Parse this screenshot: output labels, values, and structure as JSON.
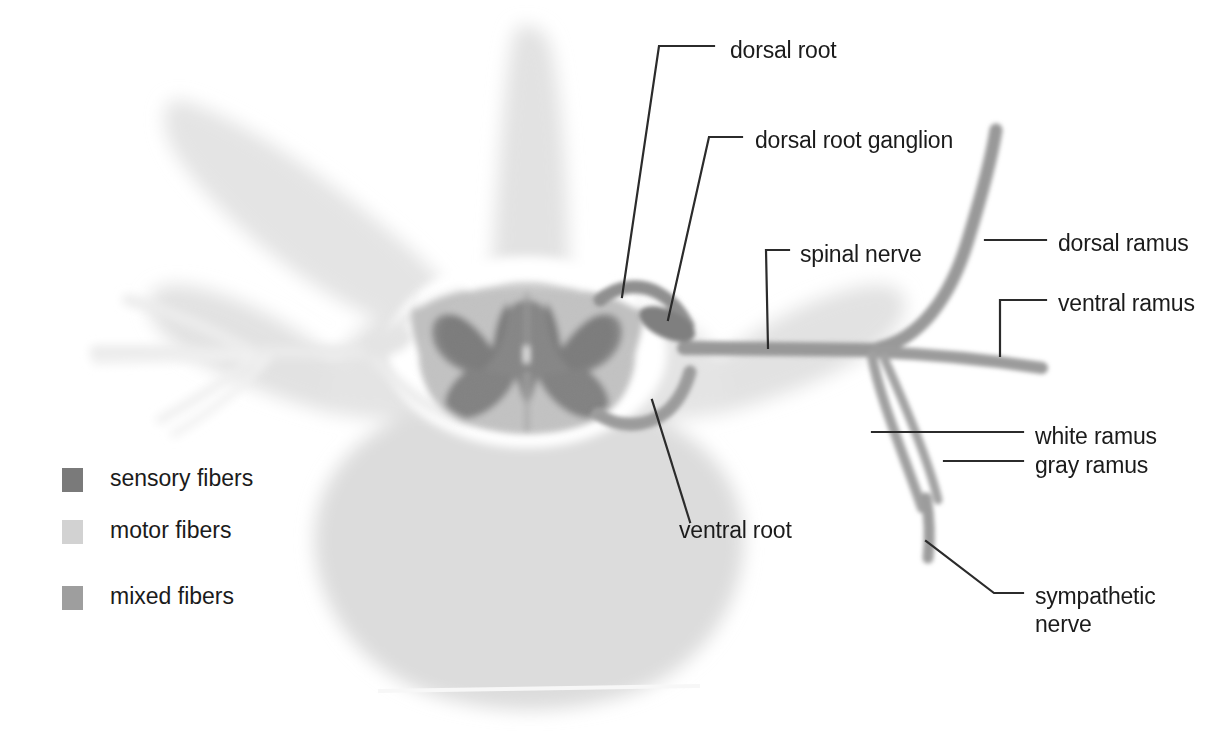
{
  "figure": {
    "background_color": "#ffffff",
    "width": 1218,
    "height": 747
  },
  "colors": {
    "sensory_fibers": "#7a7a7a",
    "motor_fibers": "#d2d2d2",
    "mixed_fibers": "#9e9e9e",
    "vertebra_bone": "#e2e2e2",
    "vertebral_body": "#dcdcdc",
    "cord_white_matter": "#bdbdbd",
    "cord_gray_matter": "#8a8a8a",
    "leader_line": "#2b2b2b",
    "text": "#1b1b1b",
    "faded_nerve": "#ededed"
  },
  "labels": [
    {
      "id": "dorsal-root",
      "text": "dorsal root",
      "x": 730,
      "y": 37
    },
    {
      "id": "dorsal-root-ganglion",
      "text": "dorsal root ganglion",
      "x": 755,
      "y": 127
    },
    {
      "id": "spinal-nerve",
      "text": "spinal nerve",
      "x": 800,
      "y": 241
    },
    {
      "id": "dorsal-ramus",
      "text": "dorsal ramus",
      "x": 1058,
      "y": 230
    },
    {
      "id": "ventral-ramus",
      "text": "ventral ramus",
      "x": 1058,
      "y": 290
    },
    {
      "id": "white-ramus",
      "text": "white ramus",
      "x": 1035,
      "y": 423
    },
    {
      "id": "gray-ramus",
      "text": "gray ramus",
      "x": 1035,
      "y": 452
    },
    {
      "id": "ventral-root",
      "text": "ventral root",
      "x": 679,
      "y": 517
    },
    {
      "id": "sympathetic-nerve-1",
      "text": "sympathetic",
      "x": 1035,
      "y": 583
    },
    {
      "id": "sympathetic-nerve-2",
      "text": "nerve",
      "x": 1035,
      "y": 611
    }
  ],
  "legend": {
    "items": [
      {
        "id": "sensory-fibers",
        "label": "sensory fibers",
        "color": "#7a7a7a",
        "swatch_x": 62,
        "swatch_y": 468,
        "text_x": 110,
        "text_y": 465
      },
      {
        "id": "motor-fibers",
        "label": "motor fibers",
        "color": "#d2d2d2",
        "swatch_x": 62,
        "swatch_y": 520,
        "text_x": 110,
        "text_y": 517
      },
      {
        "id": "mixed-fibers",
        "label": "mixed fibers",
        "color": "#9e9e9e",
        "swatch_x": 62,
        "swatch_y": 586,
        "text_x": 110,
        "text_y": 583
      }
    ]
  },
  "anatomy": {
    "structures": [
      "vertebra",
      "spinous process",
      "transverse process",
      "vertebral body",
      "spinal cord",
      "gray matter",
      "white matter",
      "dorsal root",
      "dorsal root ganglion",
      "ventral root",
      "spinal nerve",
      "dorsal ramus",
      "ventral ramus",
      "white ramus communicans",
      "gray ramus communicans",
      "sympathetic trunk"
    ]
  }
}
